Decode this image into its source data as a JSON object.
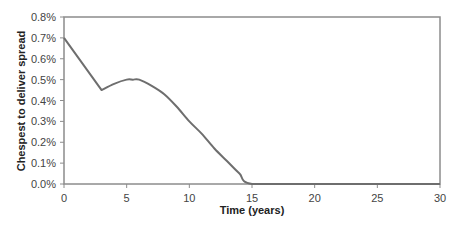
{
  "chart_data": {
    "type": "line",
    "title": "",
    "xlabel": "Time (years)",
    "ylabel": "Chespest to deliver spread",
    "xlim": [
      0,
      30
    ],
    "ylim": [
      0.0,
      0.8
    ],
    "x_ticks": [
      0,
      5,
      10,
      15,
      20,
      25,
      30
    ],
    "y_ticks": [
      "0.0%",
      "0.1%",
      "0.2%",
      "0.3%",
      "0.4%",
      "0.5%",
      "0.6%",
      "0.7%",
      "0.8%"
    ],
    "y_unit": "%",
    "grid": false,
    "legend": null,
    "series": [
      {
        "name": "Cheapest to deliver spread",
        "color": "#6e6e6e",
        "x": [
          0,
          3,
          4,
          5,
          5.5,
          6,
          7,
          8,
          9,
          10,
          11,
          12,
          13,
          14,
          15,
          20,
          25,
          30
        ],
        "values": [
          0.7,
          0.45,
          0.48,
          0.5,
          0.5,
          0.5,
          0.47,
          0.43,
          0.37,
          0.3,
          0.24,
          0.17,
          0.11,
          0.05,
          0.0,
          0.0,
          0.0,
          0.0
        ]
      }
    ]
  },
  "colors": {
    "axis": "#8c8c8c",
    "line": "#6e6e6e",
    "background": "#ffffff"
  }
}
